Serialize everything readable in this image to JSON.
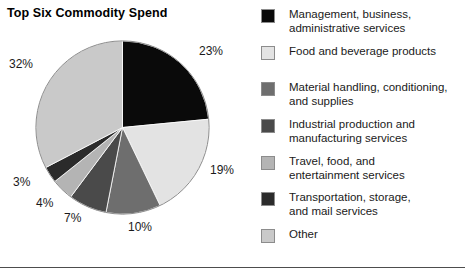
{
  "chart_title": "Top Six Commodity Spend",
  "legend": [
    {
      "label": "Management, business,\nadministrative services",
      "color": "#0a0a0a",
      "top": 0
    },
    {
      "label": "Food and beverage products",
      "color": "#e3e3e3",
      "top": 37
    },
    {
      "label": "Material handling, conditioning,\nand supplies",
      "color": "#6e6e6e",
      "top": 73
    },
    {
      "label": "Industrial production and\nmanufacturing services",
      "color": "#4a4a4a",
      "top": 110
    },
    {
      "label": "Travel, food, and\nentertainment services",
      "color": "#b4b4b4",
      "top": 147
    },
    {
      "label": "Transportation, storage,\nand mail services",
      "color": "#2b2b2b",
      "top": 183
    },
    {
      "label": "Other",
      "color": "#c9c9c9",
      "top": 220
    }
  ],
  "callouts": {
    "p23": "23%",
    "p19": "19%",
    "p10": "10%",
    "p7": "7%",
    "p4": "4%",
    "p3": "3%",
    "p32": "32%"
  },
  "chart_data": {
    "type": "pie",
    "title": "Top Six Commodity Spend",
    "xlabel": "",
    "ylabel": "",
    "units": "percent",
    "total": 98,
    "start_angle_deg": 0,
    "direction": "clockwise",
    "legend_position": "right",
    "grid": false,
    "labels": [
      "Management, business, administrative services",
      "Food and beverage products",
      "Material handling, conditioning, and supplies",
      "Industrial production and manufacturing services",
      "Travel, food, and entertainment services",
      "Transportation, storage, and mail services",
      "Other"
    ],
    "values": [
      23,
      19,
      10,
      7,
      4,
      3,
      32
    ],
    "value_labels": [
      "23%",
      "19%",
      "10%",
      "7%",
      "4%",
      "3%",
      "32%"
    ],
    "colors": [
      "#0a0a0a",
      "#e3e3e3",
      "#6e6e6e",
      "#4a4a4a",
      "#b4b4b4",
      "#2b2b2b",
      "#c9c9c9"
    ]
  }
}
